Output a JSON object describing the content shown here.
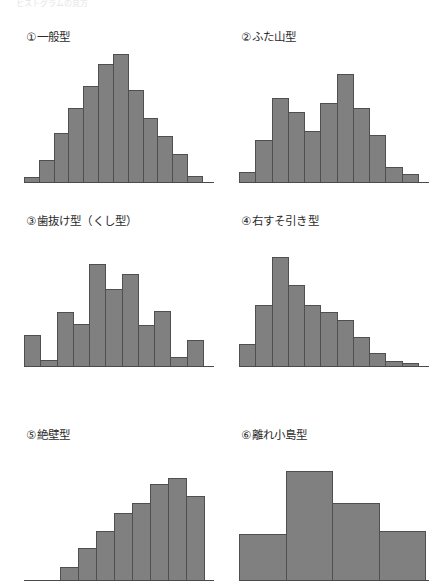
{
  "page": {
    "clipped_header_text": "ヒストグラムの見方",
    "bar_color": "#808080",
    "bar_border_color": "#4f4f4f",
    "baseline_color": "#4a4a4a",
    "background": "#ffffff"
  },
  "chart_data": [
    {
      "type": "bar",
      "id": "general-type",
      "title": "①一般型",
      "categories": [
        "1",
        "2",
        "3",
        "4",
        "5",
        "6",
        "7",
        "8",
        "9",
        "10",
        "11"
      ],
      "values": [
        4,
        17,
        38,
        58,
        75,
        92,
        100,
        72,
        50,
        36,
        22,
        5
      ],
      "xlabel": "",
      "ylabel": "",
      "ylim": [
        0,
        100
      ],
      "grid": false,
      "legend": "none"
    },
    {
      "type": "bar",
      "id": "twin-peak-type",
      "title": "②ふた山型",
      "categories": [
        "1",
        "2",
        "3",
        "4",
        "5",
        "6",
        "7",
        "8",
        "9",
        "10",
        "11"
      ],
      "values": [
        8,
        33,
        66,
        55,
        40,
        62,
        84,
        58,
        37,
        12,
        6
      ],
      "xlabel": "",
      "ylabel": "",
      "ylim": [
        0,
        100
      ],
      "grid": false,
      "legend": "none"
    },
    {
      "type": "bar",
      "id": "comb-type",
      "title": "③歯抜け型（くし型）",
      "categories": [
        "1",
        "2",
        "3",
        "4",
        "5",
        "6",
        "7",
        "8",
        "9",
        "10",
        "11"
      ],
      "values": [
        24,
        5,
        42,
        33,
        80,
        60,
        72,
        32,
        43,
        7,
        20
      ],
      "xlabel": "",
      "ylabel": "",
      "ylim": [
        0,
        100
      ],
      "grid": false,
      "legend": "none"
    },
    {
      "type": "bar",
      "id": "right-skewed-type",
      "title": "④右すそ引き型",
      "categories": [
        "1",
        "2",
        "3",
        "4",
        "5",
        "6",
        "7",
        "8",
        "9",
        "10",
        "11"
      ],
      "values": [
        17,
        48,
        85,
        63,
        48,
        42,
        36,
        23,
        10,
        4,
        2
      ],
      "xlabel": "",
      "ylabel": "",
      "ylim": [
        0,
        100
      ],
      "grid": false,
      "legend": "none"
    },
    {
      "type": "bar",
      "id": "cliff-type",
      "title": "⑤絶壁型",
      "categories": [
        "1",
        "2",
        "3",
        "4",
        "5",
        "6",
        "7",
        "8",
        "9"
      ],
      "values": [
        0,
        0,
        10,
        25,
        38,
        52,
        60,
        75,
        80,
        66
      ],
      "xlabel": "",
      "ylabel": "",
      "ylim": [
        0,
        100
      ],
      "grid": false,
      "legend": "none",
      "note": "clipped at image bottom edge"
    },
    {
      "type": "bar",
      "id": "isolated-island-type",
      "title": "⑥離れ小島型",
      "categories": [
        "1",
        "2",
        "3",
        "4"
      ],
      "values": [
        36,
        85,
        60,
        38
      ],
      "xlabel": "",
      "ylabel": "",
      "ylim": [
        0,
        100
      ],
      "grid": false,
      "legend": "none",
      "note": "clipped at image bottom edge"
    }
  ]
}
